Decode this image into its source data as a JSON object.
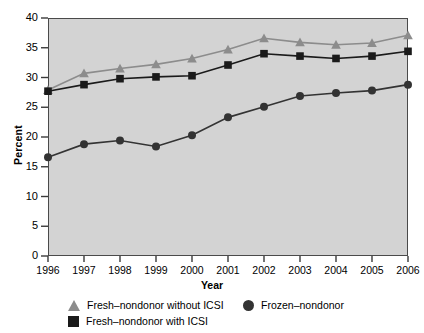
{
  "chart_data": {
    "type": "line",
    "title": "",
    "subtitle": "",
    "xlabel": "Year",
    "ylabel": "Percent",
    "categories": [
      "1996",
      "1997",
      "1998",
      "1999",
      "2000",
      "2001",
      "2002",
      "2003",
      "2004",
      "2005",
      "2006"
    ],
    "x": [
      1996,
      1997,
      1998,
      1999,
      2000,
      2001,
      2002,
      2003,
      2004,
      2005,
      2006
    ],
    "xlim": [
      1996,
      2006
    ],
    "ylim": [
      0,
      40
    ],
    "yticks": [
      0,
      5,
      10,
      15,
      20,
      25,
      30,
      35,
      40
    ],
    "grid": false,
    "legend_position": "bottom",
    "plot_background": "#d3d3d3",
    "series": [
      {
        "name": "Fresh–nondonor without ICSI",
        "marker": "triangle",
        "color": "#8c8c8c",
        "values": [
          27.9,
          30.7,
          31.5,
          32.2,
          33.2,
          34.7,
          36.6,
          35.9,
          35.5,
          35.8,
          37.1
        ]
      },
      {
        "name": "Fresh–nondonor with ICSI",
        "marker": "square",
        "color": "#1a1a1a",
        "values": [
          27.7,
          28.8,
          29.8,
          30.1,
          30.3,
          32.1,
          34.0,
          33.6,
          33.2,
          33.6,
          34.4
        ]
      },
      {
        "name": "Frozen–nondonor",
        "marker": "circle",
        "color": "#333333",
        "values": [
          16.6,
          18.8,
          19.4,
          18.4,
          20.3,
          23.3,
          25.1,
          26.9,
          27.4,
          27.8,
          28.8
        ]
      }
    ]
  },
  "legend": {
    "entries": [
      {
        "label": "Fresh–nondonor without ICSI",
        "marker": "triangle",
        "color": "#8c8c8c"
      },
      {
        "label": "Fresh–nondonor with ICSI",
        "marker": "square",
        "color": "#1a1a1a"
      },
      {
        "label": "Frozen–nondonor",
        "marker": "circle",
        "color": "#333333"
      }
    ]
  }
}
